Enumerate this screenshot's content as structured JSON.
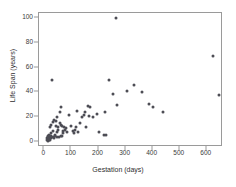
{
  "chart_data": {
    "type": "scatter",
    "title": "",
    "xlabel": "Gestation (days)",
    "ylabel": "Life Span (years)",
    "xlim": [
      -20,
      660
    ],
    "ylim": [
      -4,
      104
    ],
    "xticks": [
      0,
      100,
      200,
      300,
      400,
      500,
      600
    ],
    "xtick_labels": [
      "0",
      "100",
      "200",
      "300",
      "400",
      "500",
      "600"
    ],
    "yticks": [
      0,
      20,
      40,
      60,
      80,
      100
    ],
    "ytick_labels": [
      "0",
      "20",
      "40",
      "60",
      "80",
      "100"
    ],
    "grid": false,
    "legend": false,
    "marker_color": "#4d4d55",
    "frame_color": "#9a9a9a",
    "series": [
      {
        "name": "Animals",
        "points": [
          [
            8,
            3
          ],
          [
            10,
            2
          ],
          [
            12,
            5
          ],
          [
            13,
            3
          ],
          [
            14,
            1
          ],
          [
            15,
            4
          ],
          [
            16,
            2
          ],
          [
            17,
            6
          ],
          [
            18,
            3
          ],
          [
            19,
            5
          ],
          [
            20,
            2
          ],
          [
            21,
            12
          ],
          [
            22,
            4
          ],
          [
            23,
            14
          ],
          [
            24,
            3
          ],
          [
            25,
            7
          ],
          [
            26,
            5
          ],
          [
            28,
            50
          ],
          [
            30,
            4
          ],
          [
            31,
            9
          ],
          [
            33,
            16
          ],
          [
            35,
            3
          ],
          [
            36,
            18
          ],
          [
            38,
            6
          ],
          [
            40,
            5
          ],
          [
            42,
            17
          ],
          [
            44,
            13
          ],
          [
            45,
            4
          ],
          [
            46,
            8
          ],
          [
            48,
            20
          ],
          [
            50,
            12
          ],
          [
            52,
            10
          ],
          [
            54,
            4
          ],
          [
            56,
            24
          ],
          [
            58,
            15
          ],
          [
            60,
            5
          ],
          [
            62,
            14
          ],
          [
            63,
            28
          ],
          [
            64,
            13
          ],
          [
            65,
            5
          ],
          [
            68,
            7
          ],
          [
            70,
            9
          ],
          [
            72,
            12
          ],
          [
            75,
            10
          ],
          [
            80,
            11
          ],
          [
            85,
            8
          ],
          [
            90,
            22
          ],
          [
            100,
            13
          ],
          [
            105,
            9
          ],
          [
            110,
            7
          ],
          [
            112,
            10
          ],
          [
            115,
            12
          ],
          [
            120,
            25
          ],
          [
            125,
            8
          ],
          [
            130,
            15
          ],
          [
            140,
            20
          ],
          [
            145,
            22
          ],
          [
            150,
            24
          ],
          [
            152,
            12
          ],
          [
            160,
            29
          ],
          [
            165,
            21
          ],
          [
            170,
            28
          ],
          [
            180,
            20
          ],
          [
            195,
            23
          ],
          [
            200,
            8
          ],
          [
            220,
            6
          ],
          [
            225,
            24
          ],
          [
            228,
            6
          ],
          [
            240,
            50
          ],
          [
            255,
            39
          ],
          [
            265,
            100
          ],
          [
            270,
            30
          ],
          [
            305,
            41
          ],
          [
            330,
            46
          ],
          [
            360,
            40
          ],
          [
            385,
            31
          ],
          [
            400,
            28
          ],
          [
            440,
            24
          ],
          [
            624,
            69
          ],
          [
            645,
            38
          ]
        ]
      }
    ]
  }
}
